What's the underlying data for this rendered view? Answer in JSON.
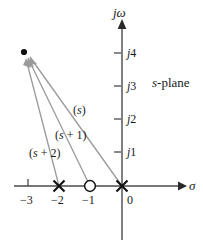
{
  "figure": {
    "name": "s-plane pole-zero vector diagram",
    "plane_label": {
      "italic": "s",
      "rest": "-plane"
    },
    "axes": {
      "vertical_label": "jω",
      "horizontal_label": "σ",
      "vertical_ticks": [
        {
          "label_prefix": "j",
          "label_num": "4",
          "value": 4
        },
        {
          "label_prefix": "j",
          "label_num": "3",
          "value": 3
        },
        {
          "label_prefix": "j",
          "label_num": "2",
          "value": 2
        },
        {
          "label_prefix": "j",
          "label_num": "1",
          "value": 1
        }
      ],
      "horizontal_ticks": [
        {
          "label": "−3",
          "value": -3
        },
        {
          "label": "−2",
          "value": -2
        },
        {
          "label": "−1",
          "value": -1
        },
        {
          "label": "0",
          "value": 0
        }
      ]
    },
    "markers": {
      "poles": [
        {
          "symbol": "X",
          "re": -2,
          "im": 0
        },
        {
          "symbol": "X",
          "re": 0,
          "im": 0
        }
      ],
      "zeros": [
        {
          "symbol": "O",
          "re": -1,
          "im": 0
        }
      ],
      "test_point": {
        "symbol": "dot",
        "re": -3.1,
        "im": 4.05
      }
    },
    "vectors": [
      {
        "label": "(s)",
        "label_italic": "s",
        "label_pre": "(",
        "label_post": ")",
        "from_re": 0,
        "from_im": 0
      },
      {
        "label": "(s + 1)",
        "label_italic": "s",
        "label_pre": "(",
        "label_post": " + 1)",
        "from_re": -1,
        "from_im": 0
      },
      {
        "label": "(s + 2)",
        "label_italic": "s",
        "label_pre": "(",
        "label_post": " + 2)",
        "from_re": -2,
        "from_im": 0
      }
    ],
    "colors": {
      "axis": "#4a4a4a",
      "vector": "#9a9a9a",
      "marker": "#1a1a1a",
      "text": "#1a1a1a",
      "background": "#ffffff"
    }
  }
}
